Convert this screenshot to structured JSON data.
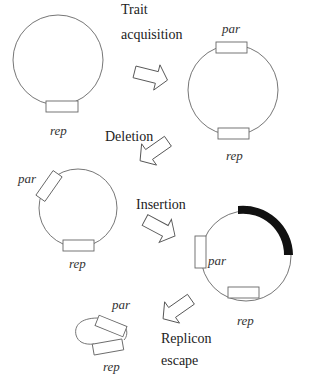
{
  "diagram": {
    "steps": [
      {
        "id": "trait",
        "label_line1": "Trait",
        "label_line2": "acquisition"
      },
      {
        "id": "deletion",
        "label_line1": "Deletion"
      },
      {
        "id": "insertion",
        "label_line1": "Insertion"
      },
      {
        "id": "escape",
        "label_line1": "Replicon",
        "label_line2": "escape"
      }
    ],
    "plasmids": [
      {
        "id": "p1",
        "genes": [
          "rep"
        ]
      },
      {
        "id": "p2",
        "genes": [
          "par",
          "rep"
        ]
      },
      {
        "id": "p3",
        "genes": [
          "par",
          "rep"
        ]
      },
      {
        "id": "p4",
        "genes": [
          "par",
          "rep"
        ],
        "insert": "black-segment"
      },
      {
        "id": "p5",
        "genes": [
          "par",
          "rep"
        ]
      }
    ],
    "gene_labels": {
      "par": "par",
      "rep": "rep"
    },
    "colors": {
      "line": "#555555",
      "insert": "#111111",
      "text": "#222222"
    }
  }
}
